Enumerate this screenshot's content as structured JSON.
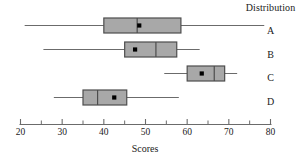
{
  "legend": {
    "header": "Distribution",
    "labels": [
      "A",
      "B",
      "C",
      "D"
    ]
  },
  "axis": {
    "title": "Scores",
    "major_ticks": [
      20,
      30,
      40,
      50,
      60,
      70,
      80
    ],
    "minor_ticks": [
      25,
      35,
      45,
      55,
      65,
      75
    ],
    "tick_labels": [
      "20",
      "30",
      "40",
      "50",
      "60",
      "70",
      "80"
    ]
  },
  "style": {
    "box_fill": "#a8a8a8",
    "box_stroke": "#4d4d4d",
    "line_color": "#6b6b6b",
    "mean_dot": "#000000",
    "text_color": "#1a1a1a",
    "background": "#ffffff"
  },
  "chart_data": {
    "type": "boxplot",
    "title": "",
    "xlabel": "Scores",
    "ylabel": "Distribution",
    "xlim": [
      20,
      80
    ],
    "grid": false,
    "legend_position": "right",
    "orientation": "horizontal",
    "categories": [
      "A",
      "B",
      "C",
      "D"
    ],
    "boxes": [
      {
        "name": "A",
        "whisker_low": 21.0,
        "q1": 40.0,
        "median": 48.0,
        "q3": 58.5,
        "whisker_high": 78.5,
        "mean": 48.5
      },
      {
        "name": "B",
        "whisker_low": 25.5,
        "q1": 45.0,
        "median": 52.5,
        "q3": 57.5,
        "whisker_high": 63.0,
        "mean": 47.5
      },
      {
        "name": "C",
        "whisker_low": 54.5,
        "q1": 60.0,
        "median": 66.5,
        "q3": 69.0,
        "whisker_high": 72.0,
        "mean": 63.5
      },
      {
        "name": "D",
        "whisker_low": 28.0,
        "q1": 35.0,
        "median": 38.5,
        "q3": 45.5,
        "whisker_high": 58.0,
        "mean": 42.5
      }
    ]
  }
}
